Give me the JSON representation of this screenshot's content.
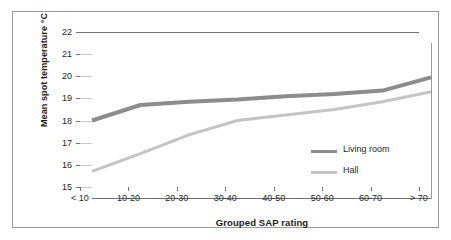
{
  "chart_data": {
    "type": "line",
    "title": "",
    "subtitle": "",
    "xlabel": "Grouped SAP rating",
    "ylabel": "Mean spot temperature °C",
    "categories": [
      "< 10",
      "10-20",
      "20-30",
      "30-40",
      "40-50",
      "50-60",
      "60-70",
      "> 70"
    ],
    "ylim": [
      15,
      22
    ],
    "yticks": [
      15,
      16,
      17,
      18,
      19,
      20,
      21,
      22
    ],
    "ytick_labels": [
      "15",
      "16",
      "17",
      "18",
      "19",
      "20",
      "21",
      "22"
    ],
    "grid": true,
    "grid_axis": "y",
    "legend_position": "inside-right",
    "series": [
      {
        "name": "Living room",
        "color": "#8c8c8c",
        "line_width": 4,
        "values": [
          18.5,
          19.2,
          19.35,
          19.45,
          19.6,
          19.7,
          19.85,
          20.45
        ]
      },
      {
        "name": "Hall",
        "color": "#c4c4c4",
        "line_width": 3,
        "values": [
          16.2,
          17.0,
          17.85,
          18.5,
          18.75,
          19.0,
          19.35,
          19.8
        ]
      }
    ]
  },
  "figure": {
    "frame_color": "#9a9a9a",
    "background": "#ffffff",
    "gridline_color": "#c8c8c8",
    "axis_color": "#707070",
    "text_color": "#262626"
  }
}
